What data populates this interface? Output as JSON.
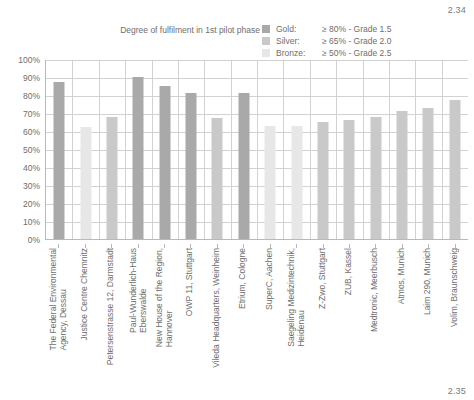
{
  "figure_number_top": "2.34",
  "figure_number_bottom": "2.35",
  "header": {
    "subtitle": "Degree of fulfilment in 1st pilot phase"
  },
  "legend": {
    "position": "top-right",
    "items": [
      {
        "name": "Gold:",
        "description": "≥ 80% - Grade 1.5",
        "color": "#a9a9a9"
      },
      {
        "name": "Silver:",
        "description": "≥ 65% - Grade 2.0",
        "color": "#c9c9c9"
      },
      {
        "name": "Bronze:",
        "description": "≥ 50% - Grade 2.5",
        "color": "#e7e7e7"
      }
    ]
  },
  "chart_data": {
    "type": "bar",
    "title": "Degree of fulfilment in 1st pilot phase",
    "xlabel": "",
    "ylabel": "",
    "ylim": [
      0,
      100
    ],
    "ytick_labels": [
      "100%",
      "90%",
      "80%",
      "70%",
      "60%",
      "50%",
      "40%",
      "30%",
      "20%",
      "10%",
      "0%"
    ],
    "ytick_values": [
      100,
      90,
      80,
      70,
      60,
      50,
      40,
      30,
      20,
      10,
      0
    ],
    "grid": true,
    "categories": [
      "The Federal Environmental\nAgency, Dessau",
      "Justice Centre Chemnitz",
      "Petersenstrasse 12, Darmstadt",
      "Paul-Wunderlich-Haus\nEberswalde",
      "New House of the Region,\nHannover",
      "OWP 11, Stuttgart",
      "Vileda Headquarters, Weinheim",
      "Etrium, Cologne",
      "SuperC, Aachen",
      "Saegeling Medizintechnik,\nHeidenau",
      "Z-Zwo, Stuttgart",
      "ZUB, Kassel",
      "Medtronic, Meerbusch",
      "Atmos, Munich",
      "Laim 290, Munich",
      "Volim, Braunschweig"
    ],
    "values": [
      87,
      62,
      68,
      90,
      85,
      81,
      67,
      81,
      63,
      63,
      65,
      66,
      68,
      71,
      73,
      77
    ],
    "bar_grades": [
      "Gold",
      "Bronze",
      "Silver",
      "Gold",
      "Gold",
      "Gold",
      "Silver",
      "Gold",
      "Bronze",
      "Bronze",
      "Silver",
      "Silver",
      "Silver",
      "Silver",
      "Silver",
      "Silver"
    ],
    "bar_colors": [
      "#a9a9a9",
      "#e7e7e7",
      "#c9c9c9",
      "#a9a9a9",
      "#a9a9a9",
      "#a9a9a9",
      "#c9c9c9",
      "#a9a9a9",
      "#e7e7e7",
      "#e7e7e7",
      "#c9c9c9",
      "#c9c9c9",
      "#c9c9c9",
      "#c9c9c9",
      "#c9c9c9",
      "#c9c9c9"
    ]
  }
}
